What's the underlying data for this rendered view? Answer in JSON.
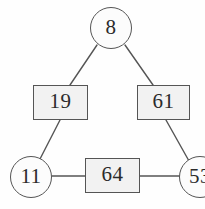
{
  "diagram": {
    "canvas": {
      "width": 205,
      "height": 209,
      "background": "#fefefe"
    },
    "style": {
      "stroke": "#555555",
      "circle_fill": "#fcfcfc",
      "rect_fill": "#f2f2f2",
      "text_color": "#2b2b2b",
      "edge_color": "#555555"
    },
    "nodes": [
      {
        "id": "n8",
        "label": "8",
        "shape": "circle",
        "cx": 111,
        "cy": 28,
        "r": 21
      },
      {
        "id": "n19",
        "label": "19",
        "shape": "rect",
        "x": 33,
        "y": 85,
        "w": 55,
        "h": 35
      },
      {
        "id": "n61",
        "label": "61",
        "shape": "rect",
        "x": 137,
        "y": 85,
        "w": 53,
        "h": 35
      },
      {
        "id": "n11",
        "label": "11",
        "shape": "circle",
        "cx": 31,
        "cy": 177,
        "r": 21
      },
      {
        "id": "n64",
        "label": "64",
        "shape": "rect",
        "x": 85,
        "y": 158,
        "w": 55,
        "h": 35
      },
      {
        "id": "n53",
        "label": "53",
        "shape": "circle",
        "cx": 200,
        "cy": 177,
        "r": 21,
        "clipped": true
      }
    ],
    "edges": [
      {
        "from": "n8",
        "to": "n19",
        "x1": 97,
        "y1": 45,
        "x2": 70,
        "y2": 85
      },
      {
        "from": "n8",
        "to": "n61",
        "x1": 125,
        "y1": 45,
        "x2": 153,
        "y2": 85
      },
      {
        "from": "n19",
        "to": "n11",
        "x1": 60,
        "y1": 120,
        "x2": 40,
        "y2": 159
      },
      {
        "from": "n61",
        "to": "n53",
        "x1": 166,
        "y1": 120,
        "x2": 189,
        "y2": 161
      },
      {
        "from": "n11",
        "to": "n64",
        "x1": 52,
        "y1": 176,
        "x2": 85,
        "y2": 176
      },
      {
        "from": "n64",
        "to": "n53",
        "x1": 140,
        "y1": 176,
        "x2": 180,
        "y2": 176
      }
    ]
  }
}
